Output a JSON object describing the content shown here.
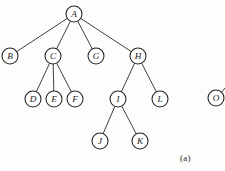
{
  "figure": {
    "caption": "(a)",
    "caption_x": 180,
    "caption_y": 153,
    "background_color": "#fdfdfc",
    "ink_color": "#222222",
    "node_radius": 8,
    "node_fill": "#ffffff"
  },
  "chart_data": {
    "type": "diagram",
    "diagram_type": "rooted-tree",
    "title": "(a)",
    "root": "A",
    "nodes": [
      {
        "id": "A",
        "label": "A",
        "x": 74,
        "y": 14,
        "r": 8,
        "depth": 0
      },
      {
        "id": "B",
        "label": "B",
        "x": 10,
        "y": 56,
        "r": 8,
        "depth": 1
      },
      {
        "id": "C",
        "label": "C",
        "x": 53,
        "y": 56,
        "r": 8,
        "depth": 1
      },
      {
        "id": "G",
        "label": "G",
        "x": 96,
        "y": 56,
        "r": 8,
        "depth": 1
      },
      {
        "id": "H",
        "label": "H",
        "x": 138,
        "y": 56,
        "r": 8,
        "depth": 1
      },
      {
        "id": "D",
        "label": "D",
        "x": 33,
        "y": 99,
        "r": 8,
        "depth": 2
      },
      {
        "id": "E",
        "label": "E",
        "x": 54,
        "y": 99,
        "r": 8,
        "depth": 2
      },
      {
        "id": "F",
        "label": "F",
        "x": 75,
        "y": 99,
        "r": 8,
        "depth": 2
      },
      {
        "id": "I",
        "label": "I",
        "x": 118,
        "y": 99,
        "r": 8,
        "depth": 2
      },
      {
        "id": "L",
        "label": "L",
        "x": 160,
        "y": 99,
        "r": 8,
        "depth": 2
      },
      {
        "id": "J",
        "label": "J",
        "x": 100,
        "y": 141,
        "r": 8,
        "depth": 3
      },
      {
        "id": "K",
        "label": "K",
        "x": 140,
        "y": 141,
        "r": 8,
        "depth": 3
      }
    ],
    "edges": [
      {
        "from": "A",
        "to": "B"
      },
      {
        "from": "A",
        "to": "C"
      },
      {
        "from": "A",
        "to": "G"
      },
      {
        "from": "A",
        "to": "H"
      },
      {
        "from": "C",
        "to": "D"
      },
      {
        "from": "C",
        "to": "E"
      },
      {
        "from": "C",
        "to": "F"
      },
      {
        "from": "H",
        "to": "I"
      },
      {
        "from": "H",
        "to": "L"
      },
      {
        "from": "I",
        "to": "J"
      },
      {
        "from": "I",
        "to": "K"
      }
    ],
    "clipped_nodes": [
      {
        "id": "O",
        "label": "O",
        "x": 216,
        "y": 98,
        "r": 8,
        "note": "partially cut off at right edge"
      }
    ],
    "clipped_edges": [
      {
        "from_x": 221,
        "from_y": 93,
        "to_x": 225,
        "to_y": 88
      }
    ]
  }
}
